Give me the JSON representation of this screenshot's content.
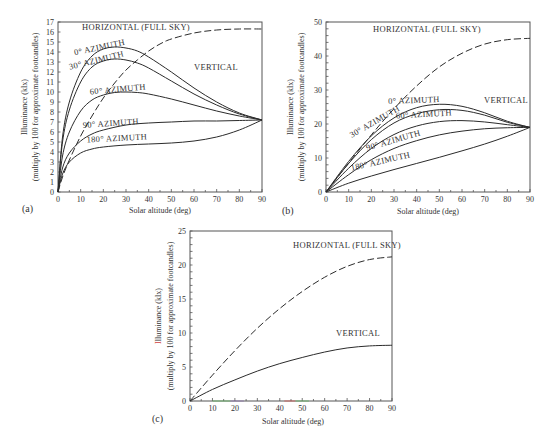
{
  "figure": {
    "panels": [
      "(a)",
      "(b)",
      "(c)"
    ]
  },
  "chart_data": [
    {
      "id": "a",
      "type": "line",
      "panel_label": "(a)",
      "title": "",
      "xlabel": "Solar altitude (deg)",
      "ylabel": "Illuminance (klx)",
      "ylabel2": "(multiply by 100 for approximate footcandles)",
      "xlim": [
        0,
        90
      ],
      "ylim": [
        0,
        17
      ],
      "xticks": [
        0,
        10,
        20,
        30,
        40,
        50,
        60,
        70,
        80,
        90
      ],
      "yticks": [
        0,
        1,
        2,
        3,
        4,
        5,
        6,
        7,
        8,
        9,
        10,
        11,
        12,
        13,
        14,
        15,
        16,
        17
      ],
      "grid": false,
      "annotations": [
        "VERTICAL"
      ],
      "series": [
        {
          "name": "HORIZONTAL (FULL SKY)",
          "style": "dashed",
          "x": [
            0,
            2,
            5,
            10,
            15,
            20,
            25,
            30,
            35,
            40,
            45,
            50,
            60,
            70,
            80,
            90
          ],
          "y": [
            0,
            1.5,
            3.2,
            5.6,
            7.6,
            9.4,
            10.9,
            12.2,
            13.2,
            14.1,
            14.8,
            15.3,
            15.9,
            16.2,
            16.3,
            16.3
          ]
        },
        {
          "name": "0° AZIMUTH",
          "style": "solid",
          "x": [
            0,
            2,
            5,
            10,
            15,
            20,
            25,
            30,
            35,
            40,
            50,
            60,
            70,
            80,
            90
          ],
          "y": [
            0,
            5.5,
            9.0,
            12.0,
            13.6,
            14.3,
            14.5,
            14.4,
            14.1,
            13.5,
            12.0,
            10.4,
            9.0,
            7.9,
            7.2
          ]
        },
        {
          "name": "30° AZIMUTH",
          "style": "solid",
          "x": [
            0,
            2,
            5,
            10,
            15,
            20,
            25,
            30,
            35,
            40,
            50,
            60,
            70,
            80,
            90
          ],
          "y": [
            0,
            5.0,
            8.2,
            11.0,
            12.5,
            13.1,
            13.3,
            13.2,
            12.9,
            12.4,
            11.1,
            9.8,
            8.7,
            7.8,
            7.2
          ]
        },
        {
          "name": "60° AZIMUTH",
          "style": "solid",
          "x": [
            0,
            2,
            5,
            10,
            15,
            20,
            25,
            30,
            35,
            40,
            50,
            60,
            70,
            80,
            90
          ],
          "y": [
            0,
            3.6,
            6.0,
            8.1,
            9.2,
            9.7,
            9.95,
            10.0,
            9.95,
            9.8,
            9.3,
            8.7,
            8.1,
            7.6,
            7.2
          ]
        },
        {
          "name": "90° AZIMUTH",
          "style": "solid",
          "x": [
            0,
            2,
            5,
            10,
            15,
            20,
            30,
            40,
            50,
            60,
            70,
            80,
            90
          ],
          "y": [
            0,
            2.4,
            3.9,
            5.1,
            5.8,
            6.2,
            6.7,
            6.9,
            7.0,
            7.1,
            7.1,
            7.15,
            7.2
          ]
        },
        {
          "name": "180° AZIMUTH",
          "style": "solid",
          "x": [
            0,
            2,
            5,
            10,
            15,
            20,
            30,
            40,
            50,
            60,
            70,
            80,
            90
          ],
          "y": [
            0,
            1.8,
            3.0,
            3.9,
            4.3,
            4.5,
            4.7,
            4.8,
            4.9,
            5.1,
            5.5,
            6.2,
            7.2
          ]
        }
      ]
    },
    {
      "id": "b",
      "type": "line",
      "panel_label": "(b)",
      "title": "",
      "xlabel": "Solar altitude (deg)",
      "ylabel": "Illuminance (klx)",
      "ylabel2": "(multiply by 100 for approximate footcandles)",
      "xlim": [
        0,
        90
      ],
      "ylim": [
        0,
        50
      ],
      "xticks": [
        0,
        10,
        20,
        30,
        40,
        50,
        60,
        70,
        80,
        90
      ],
      "yticks": [
        0,
        10,
        20,
        30,
        40,
        50
      ],
      "grid": false,
      "annotations": [
        "VERTICAL"
      ],
      "series": [
        {
          "name": "HORIZONTAL (FULL SKY)",
          "style": "dashed",
          "x": [
            0,
            10,
            20,
            30,
            40,
            50,
            60,
            70,
            80,
            90
          ],
          "y": [
            0,
            8.5,
            16.8,
            24.5,
            31.2,
            36.8,
            40.8,
            43.5,
            44.8,
            45.2
          ]
        },
        {
          "name": "0° AZIMUTH",
          "style": "solid",
          "x": [
            0,
            10,
            20,
            30,
            40,
            50,
            60,
            70,
            80,
            90
          ],
          "y": [
            0,
            9.0,
            16.5,
            21.8,
            24.8,
            25.8,
            25.2,
            23.3,
            20.8,
            19.0
          ]
        },
        {
          "name": "30° AZIMUTH",
          "style": "solid",
          "x": [
            0,
            10,
            20,
            30,
            40,
            50,
            60,
            70,
            80,
            90
          ],
          "y": [
            0,
            8.4,
            15.4,
            20.3,
            23.0,
            24.2,
            24.0,
            22.6,
            20.5,
            19.0
          ]
        },
        {
          "name": "60° AZIMUTH",
          "style": "solid",
          "x": [
            0,
            10,
            20,
            30,
            40,
            50,
            60,
            70,
            80,
            90
          ],
          "y": [
            0,
            7.0,
            12.8,
            16.9,
            19.4,
            20.7,
            21.0,
            20.6,
            19.8,
            19.0
          ]
        },
        {
          "name": "90° AZIMUTH",
          "style": "solid",
          "x": [
            0,
            10,
            20,
            30,
            40,
            50,
            60,
            70,
            80,
            90
          ],
          "y": [
            0,
            5.1,
            9.5,
            12.8,
            15.1,
            16.8,
            17.9,
            18.6,
            18.9,
            19.0
          ]
        },
        {
          "name": "180° AZIMUTH",
          "style": "solid",
          "x": [
            0,
            10,
            20,
            30,
            40,
            50,
            60,
            70,
            80,
            90
          ],
          "y": [
            0,
            2.6,
            4.7,
            6.6,
            8.4,
            10.2,
            12.1,
            14.1,
            16.4,
            19.0
          ]
        }
      ]
    },
    {
      "id": "c",
      "type": "line",
      "panel_label": "(c)",
      "title": "",
      "xlabel": "Solar altitude (deg)",
      "ylabel": "Illuminance (klx)",
      "ylabel2": "(multiply by 100 for approximate footcandles)",
      "xlim": [
        0,
        90
      ],
      "ylim": [
        0,
        25
      ],
      "xticks": [
        0,
        10,
        20,
        30,
        40,
        50,
        60,
        70,
        80,
        90
      ],
      "yticks": [
        0,
        5,
        10,
        15,
        20,
        25
      ],
      "grid": false,
      "annotations": [],
      "series": [
        {
          "name": "HORIZONTAL (FULL SKY)",
          "style": "dashed",
          "x": [
            0,
            10,
            20,
            30,
            40,
            50,
            60,
            70,
            80,
            90
          ],
          "y": [
            0,
            3.8,
            7.4,
            10.7,
            13.6,
            16.1,
            18.2,
            19.8,
            20.8,
            21.2
          ]
        },
        {
          "name": "VERTICAL",
          "style": "solid",
          "x": [
            0,
            10,
            20,
            30,
            40,
            50,
            60,
            70,
            80,
            90
          ],
          "y": [
            0,
            1.7,
            3.1,
            4.4,
            5.5,
            6.4,
            7.2,
            7.8,
            8.1,
            8.2
          ]
        }
      ]
    }
  ],
  "layout": {
    "panels": [
      {
        "x0": 58,
        "x1": 262,
        "y0": 192,
        "y1": 22,
        "ytick_step_minor": 1,
        "panel_label_pos": [
          22,
          212
        ],
        "xlabel_pos": [
          160,
          213
        ],
        "ylabel_x": [
          27,
          38
        ],
        "labels": [
          {
            "series": 0,
            "text": "HORIZONTAL (FULL SKY)",
            "x": 136,
            "y": 30,
            "rot": 0
          },
          {
            "series": 1,
            "text": "0° AZIMUTH",
            "x": 100,
            "y": 50,
            "rot": -12
          },
          {
            "series": 2,
            "text": "30° AZIMUTH",
            "x": 97,
            "y": 63,
            "rot": -14
          },
          {
            "series": 3,
            "text": "60° AZIMUTH",
            "x": 118,
            "y": 92,
            "rot": -5
          },
          {
            "series": 4,
            "text": "90° AZIMUTH",
            "x": 111,
            "y": 126,
            "rot": -4
          },
          {
            "series": 5,
            "text": "180° AZIMUTH",
            "x": 117,
            "y": 141,
            "rot": -3
          },
          {
            "annotation": 0,
            "text": "VERTICAL",
            "x": 216,
            "y": 70,
            "rot": 0
          }
        ]
      },
      {
        "x0": 326,
        "x1": 530,
        "y0": 192,
        "y1": 22,
        "ytick_step_minor": 2,
        "panel_label_pos": [
          282,
          214
        ],
        "xlabel_pos": [
          428,
          214
        ],
        "ylabel_x": [
          293,
          304
        ],
        "labels": [
          {
            "series": 0,
            "text": "HORIZONTAL (FULL SKY)",
            "x": 427,
            "y": 32,
            "rot": 0
          },
          {
            "series": 1,
            "text": "0° AZIMUTH",
            "x": 414,
            "y": 103,
            "rot": -2
          },
          {
            "series": 2,
            "text": "30° AZIMUTH",
            "x": 376,
            "y": 124,
            "rot": -30
          },
          {
            "series": 3,
            "text": "60° AZIMUTH",
            "x": 424,
            "y": 117,
            "rot": -3
          },
          {
            "series": 4,
            "text": "90° AZIMUTH",
            "x": 394,
            "y": 143,
            "rot": -16
          },
          {
            "series": 5,
            "text": "180° AZIMUTH",
            "x": 381,
            "y": 164,
            "rot": -13
          },
          {
            "annotation": 0,
            "text": "VERTICAL",
            "x": 506,
            "y": 103,
            "rot": 0
          }
        ]
      },
      {
        "x0": 190,
        "x1": 392,
        "y0": 401,
        "y1": 231,
        "ytick_step_minor": 1,
        "panel_label_pos": [
          152,
          422
        ],
        "xlabel_pos": [
          293,
          424
        ],
        "ylabel_x": [
          161,
          173
        ],
        "labels": [
          {
            "series": 0,
            "text": "HORIZONTAL (FULL SKY)",
            "x": 347,
            "y": 248,
            "rot": 0
          },
          {
            "series": 1,
            "text": "VERTICAL",
            "x": 358,
            "y": 336,
            "rot": 0
          }
        ]
      }
    ]
  },
  "colors": {
    "axis": "#555555",
    "curve": "#2b2b2b",
    "text": "#333333",
    "illuminance_initial_c": "#d04040",
    "xaxis_tint_green": "#5cb85c",
    "xaxis_tint_red": "#d9534f",
    "xaxis_tint_purple": "#8a6fb0"
  }
}
